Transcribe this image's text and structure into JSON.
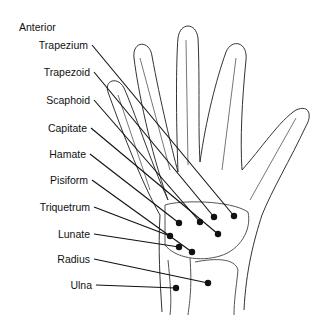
{
  "title": "Anterior",
  "labels": [
    {
      "name": "Trapezium"
    },
    {
      "name": "Trapezoid"
    },
    {
      "name": "Scaphoid"
    },
    {
      "name": "Capitate"
    },
    {
      "name": "Hamate"
    },
    {
      "name": "Pisiform"
    },
    {
      "name": "Triquetrum"
    },
    {
      "name": "Lunate"
    },
    {
      "name": "Radius"
    },
    {
      "name": "Ulna"
    }
  ],
  "colors": {
    "ink": "#111111",
    "outline": "#333333"
  }
}
